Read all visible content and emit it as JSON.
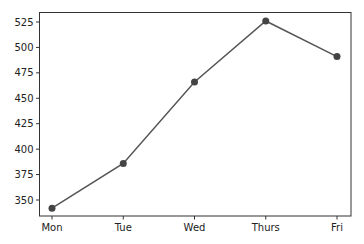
{
  "chart_data": {
    "type": "line",
    "title": "",
    "xlabel": "",
    "ylabel": "",
    "categories": [
      "Mon",
      "Tue",
      "Wed",
      "Thurs",
      "Fri"
    ],
    "values": [
      342,
      386,
      466,
      526,
      491
    ],
    "ylim": [
      333,
      535
    ],
    "yticks": [
      350,
      375,
      400,
      425,
      450,
      475,
      500,
      525
    ],
    "grid": false,
    "legend": null,
    "series_color": "#555555",
    "marker": "circle"
  }
}
